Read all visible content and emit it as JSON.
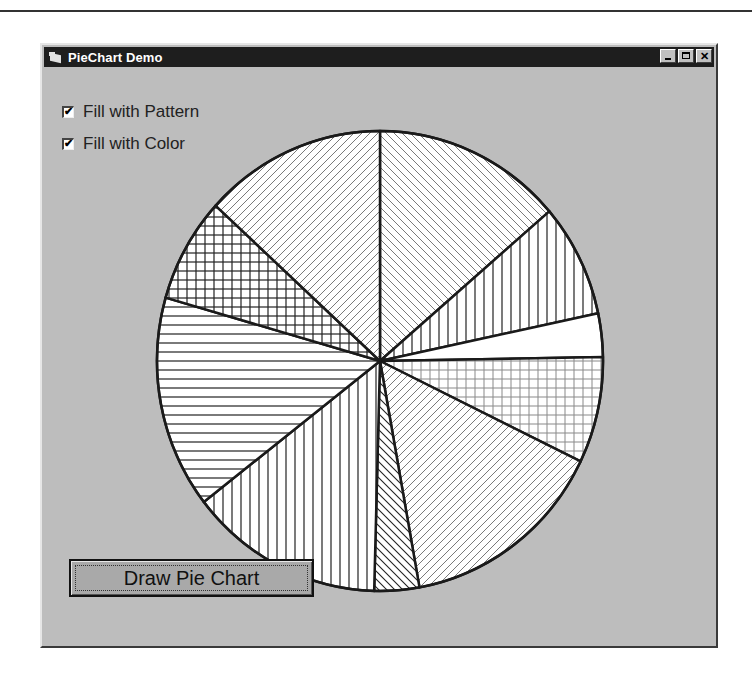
{
  "window": {
    "title": "PieChart Demo",
    "controls": {
      "minimize": "_",
      "maximize": "□",
      "close": "✕"
    },
    "app_icon": "folder-icon"
  },
  "options": {
    "fill_pattern": {
      "label": "Fill with Pattern",
      "checked": true
    },
    "fill_color": {
      "label": "Fill with Color",
      "checked": true
    }
  },
  "button": {
    "draw_label": "Draw Pie Chart"
  },
  "colors": {
    "window_bg": "#bdbdbd",
    "titlebar": "#1e1e1e",
    "slice_fill": "#ffffff",
    "outline": "#1a1a1a"
  },
  "chart_data": {
    "type": "pie",
    "title": "",
    "start_angle_deg": -90,
    "direction": "clockwise",
    "slices": [
      {
        "label": "slice-1",
        "degrees": 49.4,
        "pattern": "diag-back-light"
      },
      {
        "label": "slice-2",
        "degrees": 28.6,
        "pattern": "vertical"
      },
      {
        "label": "slice-3",
        "degrees": 11.0,
        "pattern": "solid"
      },
      {
        "label": "slice-4",
        "degrees": 26.9,
        "pattern": "grid-light"
      },
      {
        "label": "slice-5",
        "degrees": 53.9,
        "pattern": "diag-fwd-light"
      },
      {
        "label": "slice-6",
        "degrees": 11.7,
        "pattern": "diag-back"
      },
      {
        "label": "slice-7",
        "degrees": 50.7,
        "pattern": "vertical"
      },
      {
        "label": "slice-8",
        "degrees": 53.8,
        "pattern": "horizontal"
      },
      {
        "label": "slice-9",
        "degrees": 26.5,
        "pattern": "grid"
      },
      {
        "label": "slice-10",
        "degrees": 47.5,
        "pattern": "diag-fwd-light"
      }
    ],
    "center": [
      338,
      316
    ],
    "radius_x": 223,
    "radius_y": 230,
    "legend": "none"
  }
}
